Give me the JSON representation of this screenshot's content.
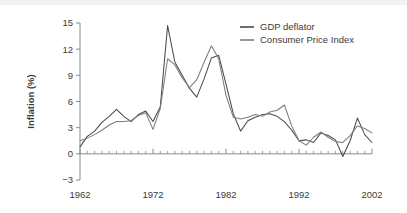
{
  "chart_data": {
    "type": "line",
    "title": "",
    "xlabel": "",
    "ylabel": "Inflation (%)",
    "xlim": [
      1962,
      2002
    ],
    "ylim": [
      -3,
      15
    ],
    "yticks": [
      -3,
      0,
      3,
      6,
      9,
      12,
      15
    ],
    "ytick_labels": [
      "−3",
      "0",
      "3",
      "6",
      "9",
      "12",
      "15"
    ],
    "xticks": [
      1962,
      1972,
      1982,
      1992,
      2002
    ],
    "xtick_labels": [
      "1962",
      "1972",
      "1982",
      "1992",
      "2002"
    ],
    "minor_xtick_step": 1,
    "grid": false,
    "legend_position": "top-right",
    "x": [
      1962,
      1963,
      1964,
      1965,
      1966,
      1967,
      1968,
      1969,
      1970,
      1971,
      1972,
      1973,
      1974,
      1975,
      1976,
      1977,
      1978,
      1979,
      1980,
      1981,
      1982,
      1983,
      1984,
      1985,
      1986,
      1987,
      1988,
      1989,
      1990,
      1991,
      1992,
      1993,
      1994,
      1995,
      1996,
      1997,
      1998,
      1999,
      2000,
      2001,
      2002
    ],
    "series": [
      {
        "name": "GDP deflator",
        "color": "#4a4a4a",
        "values": [
          0.8,
          2.0,
          2.6,
          3.6,
          4.3,
          5.1,
          4.3,
          3.7,
          4.5,
          4.9,
          3.7,
          5.4,
          14.7,
          10.5,
          9.0,
          7.5,
          6.5,
          8.6,
          11.0,
          11.3,
          8.0,
          4.6,
          2.6,
          3.8,
          4.2,
          4.5,
          4.6,
          4.3,
          3.7,
          2.7,
          1.5,
          1.6,
          1.3,
          2.4,
          2.1,
          1.6,
          -0.3,
          1.5,
          4.1,
          2.2,
          1.3
        ]
      },
      {
        "name": "Consumer Price Index",
        "color": "#7d7d7d",
        "values": [
          1.5,
          1.8,
          2.2,
          2.7,
          3.3,
          3.7,
          3.7,
          3.8,
          4.4,
          4.7,
          2.8,
          5.2,
          10.9,
          10.2,
          8.7,
          7.6,
          8.5,
          10.5,
          12.4,
          10.9,
          6.7,
          4.2,
          4.0,
          4.2,
          4.5,
          4.3,
          4.8,
          5.0,
          5.6,
          3.2,
          1.5,
          1.0,
          1.9,
          2.5,
          1.9,
          1.4,
          1.3,
          2.1,
          3.2,
          2.9,
          2.4
        ]
      }
    ]
  },
  "legend": {
    "items": [
      {
        "label": "GDP deflator"
      },
      {
        "label": "Consumer Price Index"
      }
    ]
  }
}
